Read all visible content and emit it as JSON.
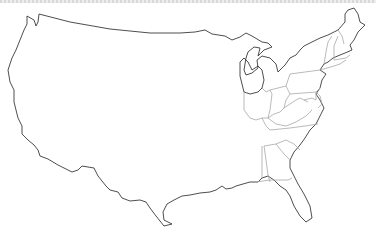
{
  "map": {
    "title": "Outline map of the contiguous United States",
    "subject": "United States (lower 48)",
    "style": "blank outline, eastern state borders shown",
    "colors": {
      "background": "#ffffff",
      "coastline": "#3a3a3a",
      "state_borders": "#a8a8a8",
      "top_border": "#d8d8d8"
    },
    "visible_state_borders_region": "Eastern US (Great Lakes, Northeast, Mid-Atlantic, Southeast)",
    "labels": []
  }
}
